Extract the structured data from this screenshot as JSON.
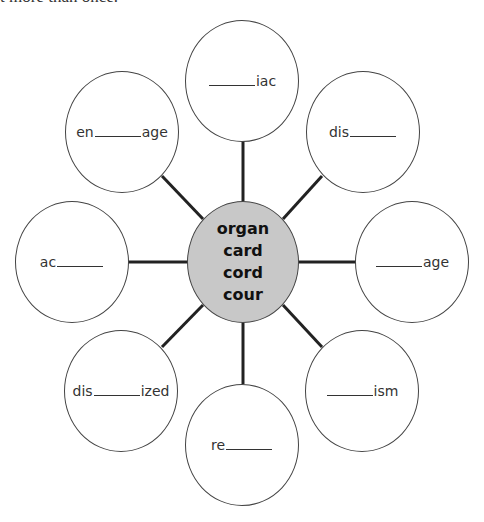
{
  "header": {
    "instruction_fragment": "t more than once."
  },
  "hub": {
    "roots": [
      "organ",
      "card",
      "cord",
      "cour"
    ],
    "fill_color": "#c8c8c8"
  },
  "nodes": [
    {
      "position": "top",
      "prefix": "",
      "suffix": "iac"
    },
    {
      "position": "top-right",
      "prefix": "dis",
      "suffix": ""
    },
    {
      "position": "right",
      "prefix": "",
      "suffix": "age"
    },
    {
      "position": "bottom-right",
      "prefix": "",
      "suffix": "ism"
    },
    {
      "position": "bottom",
      "prefix": "re",
      "suffix": ""
    },
    {
      "position": "bottom-left",
      "prefix": "dis",
      "suffix": "ized"
    },
    {
      "position": "left",
      "prefix": "ac",
      "suffix": ""
    },
    {
      "position": "top-left",
      "prefix": "en",
      "suffix": "age"
    }
  ]
}
